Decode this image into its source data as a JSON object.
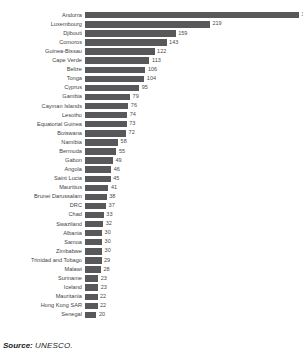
{
  "chart_data": {
    "type": "bar",
    "orientation": "horizontal",
    "title": "",
    "xlabel": "",
    "ylabel": "",
    "xlim": [
      0,
      375
    ],
    "grid": false,
    "legend": null,
    "sorted": "descending",
    "bar_color": "#58585a",
    "value_labels_shown": true,
    "categories": [
      "Andorra",
      "Luxembourg",
      "Djibouti",
      "Comoros",
      "Guinea-Bissau",
      "Cape Verde",
      "Belize",
      "Tonga",
      "Cyprus",
      "Gambia",
      "Cayman Islands",
      "Lesotho",
      "Equatorial Guinea",
      "Botswana",
      "Namibia",
      "Bermuda",
      "Gabon",
      "Angola",
      "Saint Lucia",
      "Mauritius",
      "Brunei Darussalam",
      "DRC",
      "Chad",
      "Swaziland",
      "Albania",
      "Samoa",
      "Zimbabwe",
      "Trinidad and Tobago",
      "Malawi",
      "Suriname",
      "Iceland",
      "Mauritania",
      "Hong Kong SAR",
      "Senegal"
    ],
    "values": [
      375,
      219,
      159,
      143,
      122,
      113,
      106,
      104,
      95,
      79,
      76,
      74,
      73,
      72,
      58,
      55,
      49,
      46,
      45,
      41,
      38,
      37,
      33,
      32,
      30,
      30,
      30,
      29,
      28,
      23,
      23,
      22,
      22,
      20
    ]
  },
  "footer": {
    "source_label": "Source:",
    "source_value": "UNESCO."
  }
}
